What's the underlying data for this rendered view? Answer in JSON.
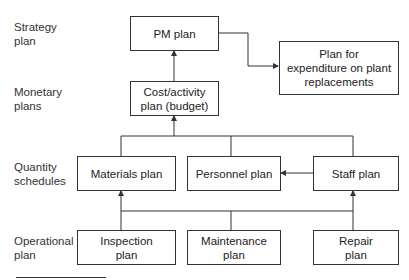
{
  "diagram": {
    "levels": [
      {
        "id": "strategy",
        "label": "Strategy plan",
        "lines": [
          "Strategy",
          "plan"
        ]
      },
      {
        "id": "monetary",
        "label": "Monetary plans",
        "lines": [
          "Monetary",
          "plans"
        ]
      },
      {
        "id": "quantity",
        "label": "Quantity schedules",
        "lines": [
          "Quantity",
          "schedules"
        ]
      },
      {
        "id": "operational",
        "label": "Operational plan",
        "lines": [
          "Operational",
          "plan"
        ]
      }
    ],
    "nodes": {
      "pm_plan": {
        "lines": [
          "PM plan"
        ]
      },
      "plant_replacement": {
        "lines": [
          "Plan for",
          "expenditure on plant",
          "replacements"
        ]
      },
      "cost_activity": {
        "lines": [
          "Cost/activity",
          "plan (budget)"
        ]
      },
      "materials": {
        "lines": [
          "Materials plan"
        ]
      },
      "personnel": {
        "lines": [
          "Personnel plan"
        ]
      },
      "staff": {
        "lines": [
          "Staff plan"
        ]
      },
      "inspection": {
        "lines": [
          "Inspection",
          "plan"
        ]
      },
      "maintenance": {
        "lines": [
          "Maintenance",
          "plan"
        ]
      },
      "repair": {
        "lines": [
          "Repair",
          "plan"
        ]
      }
    },
    "edges": [
      {
        "from": "cost_activity",
        "to": "pm_plan",
        "arrow": true
      },
      {
        "from": "pm_plan",
        "to": "plant_replacement",
        "arrow": true
      },
      {
        "from": [
          "materials",
          "personnel",
          "staff"
        ],
        "to": "cost_activity",
        "arrow": true
      },
      {
        "from": "staff",
        "to": "personnel",
        "arrow": true
      },
      {
        "from": [
          "inspection",
          "maintenance",
          "repair"
        ],
        "to": "materials",
        "arrow": true
      },
      {
        "from": [
          "inspection",
          "maintenance",
          "repair"
        ],
        "to": "staff",
        "arrow": true
      }
    ],
    "colors": {
      "line": "#333333",
      "background": "#ffffff",
      "text": "#222222"
    }
  }
}
